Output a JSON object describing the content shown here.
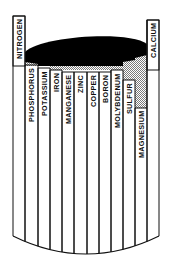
{
  "diagram": {
    "title": "",
    "concept": "Barrel of nutrient limitation (law of the minimum)",
    "colors": {
      "outline": "#111111",
      "liquid_top": "#000000",
      "hatch": "#bdbdbd",
      "background": "#ffffff"
    },
    "staves": [
      {
        "label": "NITROGEN",
        "x": 13,
        "w": 12,
        "top": 16,
        "boxed": true
      },
      {
        "label": "PHOSPHORUS",
        "x": 25,
        "w": 13,
        "top": 65,
        "boxed": false
      },
      {
        "label": "POTASSIUM",
        "x": 38,
        "w": 12,
        "top": 68,
        "boxed": false
      },
      {
        "label": "IRON",
        "x": 50,
        "w": 12,
        "top": 70,
        "boxed": false
      },
      {
        "label": "MANGANESE",
        "x": 62,
        "w": 12,
        "top": 72,
        "boxed": false
      },
      {
        "label": "ZINC",
        "x": 74,
        "w": 13,
        "top": 72,
        "boxed": false
      },
      {
        "label": "COPPER",
        "x": 87,
        "w": 12,
        "top": 72,
        "boxed": false
      },
      {
        "label": "BORON",
        "x": 99,
        "w": 12,
        "top": 72,
        "boxed": false
      },
      {
        "label": "MOLYBDENUM",
        "x": 111,
        "w": 12,
        "top": 70,
        "boxed": false
      },
      {
        "label": "SULFUR",
        "x": 123,
        "w": 12,
        "top": 80,
        "boxed": false
      },
      {
        "label": "MAGNESIUM",
        "x": 135,
        "w": 12,
        "top": 108,
        "boxed": false
      },
      {
        "label": "CALCIUM",
        "x": 147,
        "w": 12,
        "top": 20,
        "boxed": true
      }
    ]
  }
}
